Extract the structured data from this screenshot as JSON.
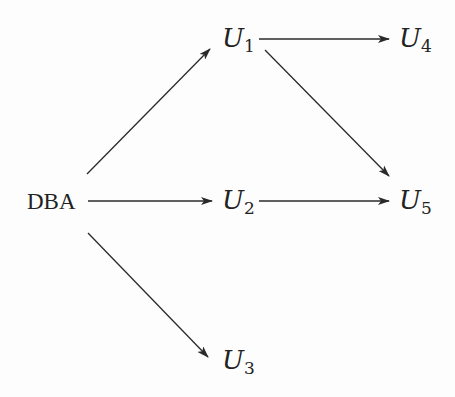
{
  "diagram": {
    "type": "directed-graph",
    "nodes": [
      {
        "id": "DBA",
        "label": "DBA",
        "base": "DBA",
        "sub": ""
      },
      {
        "id": "U1",
        "label": "U1",
        "base": "U",
        "sub": "1"
      },
      {
        "id": "U2",
        "label": "U2",
        "base": "U",
        "sub": "2"
      },
      {
        "id": "U3",
        "label": "U3",
        "base": "U",
        "sub": "3"
      },
      {
        "id": "U4",
        "label": "U4",
        "base": "U",
        "sub": "4"
      },
      {
        "id": "U5",
        "label": "U5",
        "base": "U",
        "sub": "5"
      }
    ],
    "edges": [
      {
        "from": "DBA",
        "to": "U1"
      },
      {
        "from": "DBA",
        "to": "U2"
      },
      {
        "from": "DBA",
        "to": "U3"
      },
      {
        "from": "U1",
        "to": "U4"
      },
      {
        "from": "U1",
        "to": "U5"
      },
      {
        "from": "U2",
        "to": "U5"
      }
    ],
    "colors": {
      "stroke": "#2a2a2a",
      "text": "#222222",
      "background": "#fdfdfd"
    }
  }
}
